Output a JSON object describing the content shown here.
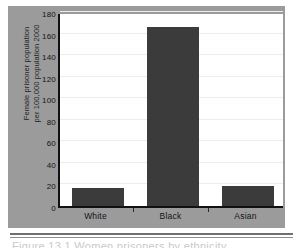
{
  "figure": {
    "caption": "Figure 13.1 Women prisoners by ethnicity"
  },
  "chart_data": {
    "type": "bar",
    "title": "",
    "xlabel": "",
    "ylabel": "Female prisoner population per 100,000 population 2000",
    "ylabel_lines": [
      "Female prisoner population",
      "per 100,000 population 2000"
    ],
    "categories": [
      "White",
      "Black",
      "Asian"
    ],
    "values": [
      17,
      166,
      19
    ],
    "ylim": [
      0,
      180
    ],
    "yticks": [
      0,
      20,
      40,
      60,
      80,
      100,
      120,
      140,
      160,
      180
    ],
    "ytick_labels": [
      "0",
      "20",
      "40",
      "60",
      "80",
      "100",
      "120",
      "140",
      "160",
      "180"
    ],
    "grid": true,
    "legend": false,
    "colors": {
      "bar": "#3b3b3b",
      "panel": "#9b9b9b",
      "plot_background": "#ffffff",
      "axis": "#111111",
      "gridline": "#ececec",
      "text": "#141414"
    }
  }
}
